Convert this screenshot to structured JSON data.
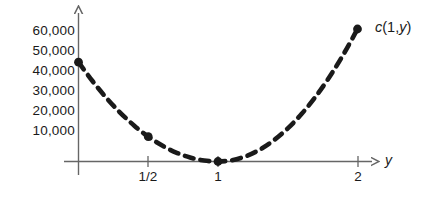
{
  "chart_data": {
    "type": "line",
    "title": "",
    "subtitle": "",
    "xlabel": "y",
    "ylabel": "",
    "annotation": "c(1,y)",
    "annotation_parts": {
      "func": "c",
      "open": "(1,",
      "var": "y",
      "close": ")"
    },
    "grid": false,
    "legend": "none",
    "line_style": "dashed",
    "line_color": "#1a1a1a",
    "axis_color": "#666666",
    "marker_color": "#1a1a1a",
    "xlim": [
      -0.12,
      2.3
    ],
    "ylim": [
      0,
      66000
    ],
    "xticks": [
      {
        "value": 0.5,
        "label": "1/2"
      },
      {
        "value": 1,
        "label": "1"
      },
      {
        "value": 2,
        "label": "2"
      }
    ],
    "yticks": [
      {
        "value": 60000,
        "label": "60,000"
      },
      {
        "value": 50000,
        "label": "50,000"
      },
      {
        "value": 40000,
        "label": "40,000"
      },
      {
        "value": 30000,
        "label": "30,000"
      },
      {
        "value": 20000,
        "label": "20,000"
      },
      {
        "value": 10000,
        "label": "10,000"
      }
    ],
    "x": [
      0.0,
      0.1,
      0.2,
      0.3,
      0.4,
      0.5,
      0.6,
      0.7,
      0.8,
      0.9,
      1.0,
      1.1,
      1.2,
      1.3,
      1.4,
      1.5,
      1.6,
      1.7,
      1.8,
      1.9,
      2.0
    ],
    "values": [
      45000,
      36450,
      28800,
      22050,
      16200,
      11250,
      7200,
      4050,
      1800,
      450,
      0,
      600,
      2400,
      5400,
      9600,
      15000,
      21600,
      29400,
      38400,
      48600,
      60000
    ],
    "markers": [
      {
        "x": 0.0,
        "y": 45000
      },
      {
        "x": 0.5,
        "y": 11250
      },
      {
        "x": 1.0,
        "y": 0
      },
      {
        "x": 2.0,
        "y": 60000
      }
    ]
  }
}
